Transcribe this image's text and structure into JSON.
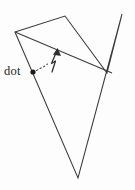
{
  "figure": {
    "type": "geometry-diagram",
    "background_color": "#fdfdfd",
    "stroke_color": "#3a3a3a",
    "canvas": {
      "width": 135,
      "height": 190
    },
    "top_cropped_text": "",
    "labels": {
      "dot_label": "dot"
    },
    "annotations": {
      "dot_marker_name": "dot-point-marker",
      "arrow_name": "curved-up-arrow",
      "leader_name": "dashed-leader-line"
    },
    "geometry": {
      "outline_points": "15,32 65,16 107,73 122,14 78,178",
      "chord_points": "15,32 112,73",
      "dot": {
        "x": 33,
        "y": 72,
        "r": 2.6
      },
      "leader_path": "M 36.5,70.5 L 40,68.5 L 44,66.5 L 47.5,64",
      "arrow_path": "M 52,72 L 55.5,61 L 51.5,63.5 L 56,53",
      "arrow_head": "57.5,48.5 60.5,55.5 53.5,54.5"
    }
  }
}
